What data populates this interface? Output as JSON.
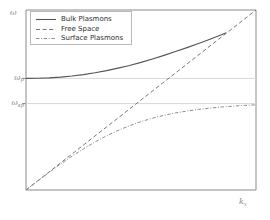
{
  "chart_data": {
    "type": "line",
    "title": "",
    "xlabel": "k_x",
    "ylabel": "ω",
    "xlabel_display": "k",
    "xlabel_sub": "x",
    "ylabel_display": "ω",
    "grid": true,
    "legend_position": "upper left",
    "xlim": [
      0,
      1
    ],
    "ylim": [
      0,
      1
    ],
    "xticks": [],
    "yticks": [
      {
        "value": 0.62,
        "label_main": "ω",
        "label_sub": "p",
        "label": "ωp"
      },
      {
        "value": 0.48,
        "label_main": "ω",
        "label_sub": "sp",
        "label": "ωsp"
      }
    ],
    "reference_lines": [
      {
        "name": "omega-p-gridline",
        "y": 0.62,
        "style": "solid",
        "color": "#d8d8d8"
      },
      {
        "name": "omega-sp-gridline",
        "y": 0.48,
        "style": "solid",
        "color": "#d8d8d8"
      }
    ],
    "series": [
      {
        "name": "Bulk Plasmons",
        "style": "solid",
        "color": "#555555",
        "x": [
          0.0,
          0.05,
          0.1,
          0.15,
          0.2,
          0.25,
          0.3,
          0.35,
          0.4,
          0.45,
          0.5,
          0.55,
          0.6,
          0.65,
          0.7,
          0.75,
          0.8,
          0.85,
          0.87
        ],
        "y": [
          0.62,
          0.621,
          0.623,
          0.627,
          0.633,
          0.641,
          0.651,
          0.663,
          0.677,
          0.692,
          0.709,
          0.728,
          0.748,
          0.769,
          0.791,
          0.814,
          0.838,
          0.863,
          0.873
        ]
      },
      {
        "name": "Free Space",
        "style": "dashed",
        "color": "#777777",
        "x": [
          0.0,
          1.0
        ],
        "y": [
          0.0,
          1.0
        ]
      },
      {
        "name": "Surface Plasmons",
        "style": "dashdot",
        "color": "#8c8c8c",
        "x": [
          0.0,
          0.05,
          0.1,
          0.15,
          0.2,
          0.25,
          0.3,
          0.35,
          0.4,
          0.45,
          0.5,
          0.55,
          0.6,
          0.65,
          0.7,
          0.75,
          0.8,
          0.85,
          0.9,
          0.95,
          1.0
        ],
        "y": [
          0.0,
          0.049,
          0.097,
          0.144,
          0.188,
          0.229,
          0.267,
          0.301,
          0.331,
          0.357,
          0.38,
          0.399,
          0.415,
          0.428,
          0.439,
          0.448,
          0.455,
          0.461,
          0.466,
          0.47,
          0.473
        ]
      }
    ],
    "legend_entries": [
      {
        "label": "Bulk Plasmons",
        "style": "solid"
      },
      {
        "label": "Free Space",
        "style": "dashed"
      },
      {
        "label": "Surface Plasmons",
        "style": "dashdot"
      }
    ],
    "colors": {
      "axis": "#8a8a8a",
      "grid": "#d8d8d8",
      "background": "#ffffff",
      "text": "#2e2e2e",
      "tick_text": "#8a8a8a"
    }
  }
}
